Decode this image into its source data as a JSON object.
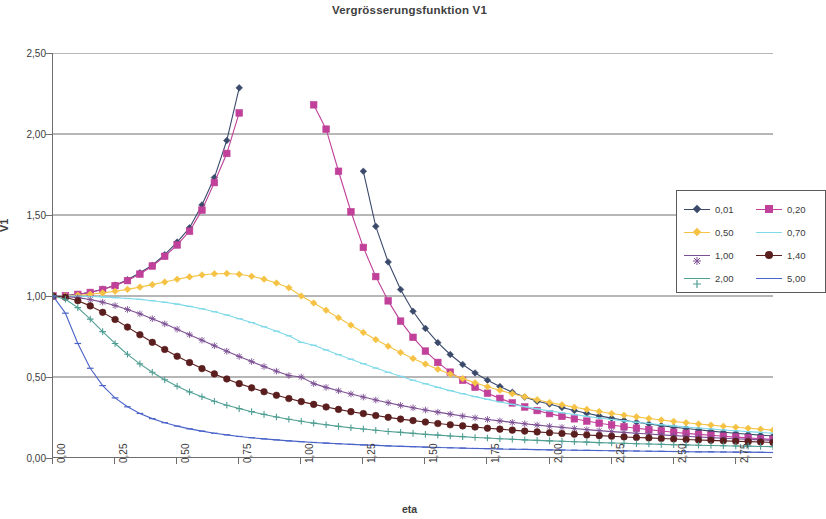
{
  "title": "Vergrösserungsfunktion V1",
  "axes": {
    "x_title": "eta",
    "y_title": "V1",
    "y_ticks": [
      "0,00",
      "0,50",
      "1,00",
      "1,50",
      "2,00",
      "2,50"
    ],
    "x_ticks": [
      "0,00",
      "0,25",
      "0,50",
      "0,75",
      "1,00",
      "1,25",
      "1,50",
      "1,75",
      "2,00",
      "2,25",
      "2,50",
      "2,75"
    ]
  },
  "legend": {
    "items": [
      {
        "label": "0,01",
        "color": "#3b4a6b",
        "marker": "diamond"
      },
      {
        "label": "0,20",
        "color": "#c0409a",
        "marker": "square"
      },
      {
        "label": "0,50",
        "color": "#f5c243",
        "marker": "diamond"
      },
      {
        "label": "0,70",
        "color": "#7fd9e8",
        "marker": "dash"
      },
      {
        "label": "1,00",
        "color": "#7c4f93",
        "marker": "star"
      },
      {
        "label": "1,40",
        "color": "#5a1e1e",
        "marker": "circle"
      },
      {
        "label": "2,00",
        "color": "#4f9e92",
        "marker": "plus"
      },
      {
        "label": "5,00",
        "color": "#4a63c8",
        "marker": "dash"
      }
    ]
  },
  "chart_data": {
    "type": "line",
    "title": "Vergrösserungsfunktion V1",
    "xlabel": "eta",
    "ylabel": "V1",
    "xlim": [
      0.0,
      2.9
    ],
    "ylim": [
      0.0,
      2.5
    ],
    "grid": "horizontal",
    "legend_position": "right",
    "x": [
      0.0,
      0.05,
      0.1,
      0.15,
      0.2,
      0.25,
      0.3,
      0.35,
      0.4,
      0.45,
      0.5,
      0.55,
      0.6,
      0.65,
      0.7,
      0.75,
      0.8,
      0.85,
      0.9,
      0.95,
      1.0,
      1.05,
      1.1,
      1.15,
      1.2,
      1.25,
      1.3,
      1.35,
      1.4,
      1.45,
      1.5,
      1.55,
      1.6,
      1.65,
      1.7,
      1.75,
      1.8,
      1.85,
      1.9,
      1.95,
      2.0,
      2.05,
      2.1,
      2.15,
      2.2,
      2.25,
      2.3,
      2.35,
      2.4,
      2.45,
      2.5,
      2.55,
      2.6,
      2.65,
      2.7,
      2.75,
      2.8,
      2.85,
      2.9
    ],
    "series": [
      {
        "name": "0,01",
        "color": "#3b4a6b",
        "marker": "diamond",
        "note": "Resonance peak clipped by plot top at 2,50; visible branch rises to ~1.96 at eta 0.72 then re-enters descending from ~1.77 at eta 1.27",
        "values": [
          1.0,
          1.003,
          1.01,
          1.023,
          1.042,
          1.067,
          1.1,
          1.143,
          1.19,
          1.255,
          1.333,
          1.421,
          1.562,
          1.731,
          1.96,
          2.285,
          null,
          null,
          null,
          null,
          null,
          null,
          null,
          null,
          null,
          1.77,
          1.43,
          1.21,
          1.04,
          0.906,
          0.8,
          0.712,
          0.639,
          0.577,
          0.525,
          0.48,
          0.441,
          0.406,
          0.376,
          0.35,
          0.333,
          0.312,
          0.293,
          0.276,
          0.26,
          0.246,
          0.233,
          0.221,
          0.21,
          0.2,
          0.19,
          0.182,
          0.174,
          0.166,
          0.159,
          0.153,
          0.147,
          0.141,
          0.136
        ]
      },
      {
        "name": "0,20",
        "color": "#c0409a",
        "marker": "square",
        "note": "Peak clipped at top; visible branch to ~1.88 at eta 0.74, re-enters at ~2.03 at eta 1.10",
        "values": [
          1.0,
          1.002,
          1.01,
          1.022,
          1.04,
          1.064,
          1.095,
          1.135,
          1.185,
          1.245,
          1.315,
          1.4,
          1.53,
          1.7,
          1.88,
          2.13,
          null,
          null,
          null,
          null,
          null,
          2.18,
          2.03,
          1.77,
          1.52,
          1.3,
          1.12,
          0.97,
          0.845,
          0.745,
          0.66,
          0.59,
          0.53,
          0.48,
          0.437,
          0.4,
          0.368,
          0.34,
          0.315,
          0.293,
          0.274,
          0.257,
          0.242,
          0.228,
          0.215,
          0.204,
          0.193,
          0.184,
          0.175,
          0.167,
          0.159,
          0.152,
          0.146,
          0.14,
          0.134,
          0.129,
          0.124,
          0.119,
          0.115
        ]
      },
      {
        "name": "0,50",
        "color": "#f5c243",
        "marker": "diamond",
        "values": [
          1.0,
          1.001,
          1.005,
          1.011,
          1.019,
          1.029,
          1.041,
          1.055,
          1.07,
          1.086,
          1.103,
          1.118,
          1.13,
          1.137,
          1.139,
          1.134,
          1.122,
          1.104,
          1.08,
          1.051,
          1.0,
          0.957,
          0.912,
          0.866,
          0.82,
          0.775,
          0.731,
          0.69,
          0.651,
          0.614,
          0.58,
          0.548,
          0.518,
          0.49,
          0.464,
          0.44,
          0.418,
          0.397,
          0.378,
          0.36,
          0.343,
          0.328,
          0.313,
          0.3,
          0.287,
          0.275,
          0.264,
          0.254,
          0.244,
          0.235,
          0.226,
          0.218,
          0.21,
          0.203,
          0.196,
          0.19,
          0.184,
          0.178,
          0.172
        ]
      },
      {
        "name": "0,70",
        "color": "#7fd9e8",
        "marker": "dash",
        "values": [
          1.0,
          1.0,
          0.999,
          0.997,
          0.994,
          0.99,
          0.985,
          0.979,
          0.971,
          0.961,
          0.95,
          0.936,
          0.921,
          0.903,
          0.883,
          0.86,
          0.836,
          0.81,
          0.783,
          0.754,
          0.714,
          0.696,
          0.667,
          0.638,
          0.61,
          0.582,
          0.555,
          0.529,
          0.504,
          0.48,
          0.458,
          0.436,
          0.416,
          0.397,
          0.379,
          0.362,
          0.346,
          0.331,
          0.317,
          0.303,
          0.291,
          0.279,
          0.268,
          0.257,
          0.247,
          0.238,
          0.229,
          0.221,
          0.213,
          0.205,
          0.198,
          0.191,
          0.185,
          0.179,
          0.173,
          0.168,
          0.163,
          0.158,
          0.153
        ]
      },
      {
        "name": "1,00",
        "color": "#7c4f93",
        "marker": "star",
        "values": [
          1.0,
          0.997,
          0.99,
          0.978,
          0.962,
          0.941,
          0.917,
          0.89,
          0.86,
          0.828,
          0.795,
          0.761,
          0.727,
          0.693,
          0.659,
          0.627,
          0.595,
          0.565,
          0.536,
          0.509,
          0.5,
          0.459,
          0.436,
          0.415,
          0.395,
          0.376,
          0.358,
          0.341,
          0.325,
          0.31,
          0.296,
          0.283,
          0.271,
          0.259,
          0.248,
          0.238,
          0.229,
          0.22,
          0.211,
          0.203,
          0.196,
          0.189,
          0.182,
          0.175,
          0.169,
          0.163,
          0.158,
          0.153,
          0.148,
          0.143,
          0.138,
          0.134,
          0.13,
          0.126,
          0.122,
          0.119,
          0.115,
          0.112,
          0.109
        ]
      },
      {
        "name": "1,40",
        "color": "#5a1e1e",
        "marker": "circle",
        "values": [
          1.0,
          0.992,
          0.971,
          0.939,
          0.899,
          0.855,
          0.808,
          0.761,
          0.714,
          0.67,
          0.628,
          0.589,
          0.552,
          0.519,
          0.488,
          0.459,
          0.433,
          0.409,
          0.387,
          0.367,
          0.348,
          0.331,
          0.315,
          0.3,
          0.286,
          0.274,
          0.262,
          0.251,
          0.24,
          0.231,
          0.222,
          0.213,
          0.205,
          0.198,
          0.191,
          0.184,
          0.178,
          0.172,
          0.166,
          0.161,
          0.156,
          0.151,
          0.147,
          0.142,
          0.138,
          0.134,
          0.13,
          0.127,
          0.124,
          0.12,
          0.117,
          0.114,
          0.111,
          0.109,
          0.106,
          0.103,
          0.101,
          0.099,
          0.096
        ]
      },
      {
        "name": "2,00",
        "color": "#4f9e92",
        "marker": "plus",
        "values": [
          1.0,
          0.98,
          0.928,
          0.857,
          0.78,
          0.707,
          0.64,
          0.581,
          0.529,
          0.483,
          0.443,
          0.408,
          0.378,
          0.35,
          0.326,
          0.305,
          0.286,
          0.269,
          0.253,
          0.239,
          0.227,
          0.215,
          0.205,
          0.195,
          0.187,
          0.179,
          0.171,
          0.164,
          0.158,
          0.152,
          0.146,
          0.141,
          0.136,
          0.132,
          0.127,
          0.123,
          0.119,
          0.116,
          0.112,
          0.109,
          0.106,
          0.103,
          0.1,
          0.098,
          0.095,
          0.093,
          0.091,
          0.088,
          0.086,
          0.084,
          0.082,
          0.081,
          0.079,
          0.077,
          0.076,
          0.074,
          0.073,
          0.071,
          0.07
        ]
      },
      {
        "name": "5,00",
        "color": "#4a63c8",
        "marker": "dash",
        "values": [
          1.0,
          0.894,
          0.707,
          0.554,
          0.447,
          0.371,
          0.316,
          0.275,
          0.243,
          0.218,
          0.197,
          0.18,
          0.166,
          0.153,
          0.143,
          0.133,
          0.125,
          0.118,
          0.112,
          0.106,
          0.101,
          0.096,
          0.092,
          0.088,
          0.084,
          0.081,
          0.078,
          0.075,
          0.072,
          0.07,
          0.067,
          0.065,
          0.063,
          0.061,
          0.059,
          0.058,
          0.056,
          0.054,
          0.053,
          0.052,
          0.05,
          0.049,
          0.048,
          0.047,
          0.046,
          0.045,
          0.044,
          0.043,
          0.042,
          0.041,
          0.04,
          0.039,
          0.038,
          0.038,
          0.037,
          0.036,
          0.036,
          0.035,
          0.034
        ]
      }
    ]
  }
}
